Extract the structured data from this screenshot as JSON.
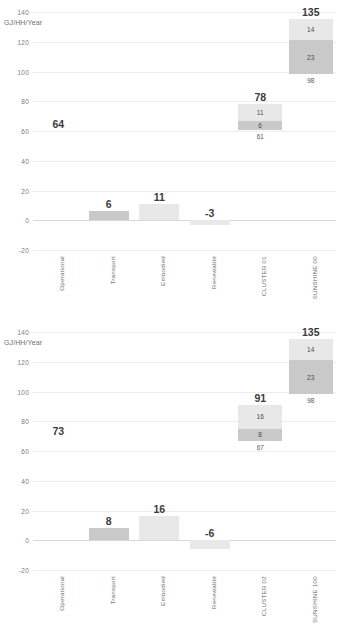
{
  "chart_data": [
    {
      "type": "bar",
      "title": "",
      "ylabel": "GJ/HH/Year",
      "xlabel": "",
      "ylim": [
        -20,
        140
      ],
      "yticks": [
        140,
        120,
        100,
        80,
        60,
        40,
        20,
        0,
        -20
      ],
      "grid": true,
      "legend": "none",
      "categories": [
        "Operational",
        "Transport",
        "Embodied",
        "Renewable",
        "CLUSTER 01",
        "SUNSHINE  00"
      ],
      "values": [
        64,
        6,
        11,
        -3,
        78,
        135
      ],
      "columns": [
        {
          "label": "Operational",
          "total": 64,
          "drawn": false,
          "segments": []
        },
        {
          "label": "Transport",
          "total": 6,
          "drawn": true,
          "segments": [
            {
              "value": 6,
              "shade": "mid",
              "show_label": false
            }
          ]
        },
        {
          "label": "Embodied",
          "total": 11,
          "drawn": true,
          "segments": [
            {
              "value": 11,
              "shade": "light",
              "show_label": false
            }
          ]
        },
        {
          "label": "Renewable",
          "total": -3,
          "drawn": true,
          "segments": [
            {
              "value": -3,
              "shade": "light",
              "show_label": false
            }
          ]
        },
        {
          "label": "CLUSTER 01",
          "total": 78,
          "drawn": true,
          "base": 61,
          "segments": [
            {
              "value": 11,
              "shade": "light",
              "show_label": true
            },
            {
              "value": 6,
              "shade": "mid",
              "show_label": true
            }
          ]
        },
        {
          "label": "SUNSHINE  00",
          "total": 135,
          "drawn": true,
          "base": 98,
          "segments": [
            {
              "value": 14,
              "shade": "light",
              "show_label": true
            },
            {
              "value": 23,
              "shade": "mid",
              "show_label": true
            }
          ]
        }
      ]
    },
    {
      "type": "bar",
      "title": "",
      "ylabel": "GJ/HH/Year",
      "xlabel": "",
      "ylim": [
        -20,
        140
      ],
      "yticks": [
        140,
        120,
        100,
        80,
        60,
        40,
        20,
        0,
        -20
      ],
      "grid": true,
      "legend": "none",
      "categories": [
        "Operational",
        "Transport",
        "Embodied",
        "Renewable",
        "CLUSTER 02",
        "SUNSHINE 100"
      ],
      "values": [
        73,
        8,
        16,
        -6,
        91,
        135
      ],
      "columns": [
        {
          "label": "Operational",
          "total": 73,
          "drawn": false,
          "segments": []
        },
        {
          "label": "Transport",
          "total": 8,
          "drawn": true,
          "segments": [
            {
              "value": 8,
              "shade": "mid",
              "show_label": false
            }
          ]
        },
        {
          "label": "Embodied",
          "total": 16,
          "drawn": true,
          "segments": [
            {
              "value": 16,
              "shade": "light",
              "show_label": false
            }
          ]
        },
        {
          "label": "Renewable",
          "total": -6,
          "drawn": true,
          "segments": [
            {
              "value": -6,
              "shade": "light",
              "show_label": false
            }
          ]
        },
        {
          "label": "CLUSTER 02",
          "total": 91,
          "drawn": true,
          "base": 67,
          "segments": [
            {
              "value": 16,
              "shade": "light",
              "show_label": true
            },
            {
              "value": 8,
              "shade": "mid",
              "show_label": true
            }
          ]
        },
        {
          "label": "SUNSHINE 100",
          "total": 135,
          "drawn": true,
          "base": 98,
          "segments": [
            {
              "value": 14,
              "shade": "light",
              "show_label": true
            },
            {
              "value": 23,
              "shade": "mid",
              "show_label": true
            }
          ]
        }
      ]
    }
  ],
  "colors": {
    "segment_light": "#e8e8e8",
    "segment_mid": "#c9c9c9",
    "segment_base": "#ffffff",
    "gridline": "#ececec",
    "zero_line": "#d8d8d8",
    "tick_text": "#7a7a7a",
    "value_text": "#3b3b3b",
    "background": "#ffffff"
  }
}
